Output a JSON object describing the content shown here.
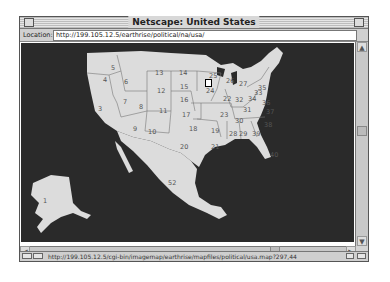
{
  "window": {
    "title": "Netscape: United States"
  },
  "location": {
    "label": "Location:",
    "url": "http://199.105.12.5/earthrise/political/na/usa/"
  },
  "status": {
    "text": "http://199.105.12.5/cgi-bin/imagemap/earthrise/mapfiles/political/usa.map?297,44"
  },
  "map": {
    "background": "#2a2a2a",
    "land": "#dcdcdc",
    "labels": [
      {
        "id": "1",
        "x": 22,
        "y": 155
      },
      {
        "id": "3",
        "x": 77,
        "y": 63
      },
      {
        "id": "4",
        "x": 82,
        "y": 34
      },
      {
        "id": "5",
        "x": 90,
        "y": 22
      },
      {
        "id": "6",
        "x": 103,
        "y": 36
      },
      {
        "id": "7",
        "x": 102,
        "y": 56
      },
      {
        "id": "8",
        "x": 118,
        "y": 61
      },
      {
        "id": "9",
        "x": 112,
        "y": 83
      },
      {
        "id": "10",
        "x": 127,
        "y": 86
      },
      {
        "id": "11",
        "x": 138,
        "y": 65
      },
      {
        "id": "12",
        "x": 136,
        "y": 45
      },
      {
        "id": "13",
        "x": 134,
        "y": 27
      },
      {
        "id": "14",
        "x": 158,
        "y": 27
      },
      {
        "id": "15",
        "x": 159,
        "y": 41
      },
      {
        "id": "16",
        "x": 159,
        "y": 54
      },
      {
        "id": "17",
        "x": 161,
        "y": 69
      },
      {
        "id": "18",
        "x": 168,
        "y": 83
      },
      {
        "id": "19",
        "x": 190,
        "y": 85
      },
      {
        "id": "20",
        "x": 159,
        "y": 101
      },
      {
        "id": "21",
        "x": 190,
        "y": 101
      },
      {
        "id": "22",
        "x": 202,
        "y": 53
      },
      {
        "id": "23",
        "x": 199,
        "y": 69
      },
      {
        "id": "24",
        "x": 185,
        "y": 45
      },
      {
        "id": "25",
        "x": 188,
        "y": 30
      },
      {
        "id": "26",
        "x": 205,
        "y": 35
      },
      {
        "id": "27",
        "x": 218,
        "y": 38
      },
      {
        "id": "28",
        "x": 208,
        "y": 88
      },
      {
        "id": "29",
        "x": 218,
        "y": 88
      },
      {
        "id": "30",
        "x": 214,
        "y": 75
      },
      {
        "id": "31",
        "x": 222,
        "y": 64
      },
      {
        "id": "32",
        "x": 214,
        "y": 54
      },
      {
        "id": "33",
        "x": 233,
        "y": 47
      },
      {
        "id": "34",
        "x": 227,
        "y": 53
      },
      {
        "id": "35",
        "x": 237,
        "y": 42
      },
      {
        "id": "36",
        "x": 241,
        "y": 57
      },
      {
        "id": "37",
        "x": 245,
        "y": 66
      },
      {
        "id": "38",
        "x": 243,
        "y": 79
      },
      {
        "id": "39",
        "x": 231,
        "y": 88
      },
      {
        "id": "40",
        "x": 249,
        "y": 109
      },
      {
        "id": "52",
        "x": 147,
        "y": 137
      }
    ]
  }
}
